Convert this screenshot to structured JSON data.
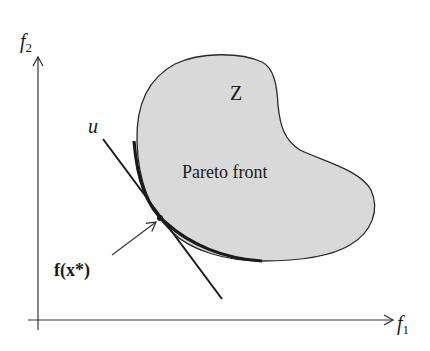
{
  "figure": {
    "type": "pareto-front-diagram",
    "axes": {
      "x_label": "f",
      "x_sub": "1",
      "y_label": "f",
      "y_sub": "2"
    },
    "region_label": "Z",
    "front_label": "Pareto front",
    "tangent_label": "u",
    "point_label": "f(x*)",
    "colors": {
      "region_fill": "#d9d9d9",
      "stroke": "#2a2a2a",
      "background": "#ffffff"
    }
  }
}
